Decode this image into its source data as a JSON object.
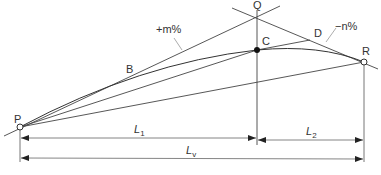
{
  "diagram": {
    "type": "vertical-curve-crest",
    "colors": {
      "line": "#444444",
      "text": "#333333",
      "background": "#ffffff"
    },
    "points": {
      "P": {
        "label": "P",
        "marker": "open-circle"
      },
      "Q": {
        "label": "Q",
        "marker": "none"
      },
      "C": {
        "label": "C",
        "marker": "filled-dot"
      },
      "D": {
        "label": "D",
        "marker": "none"
      },
      "R": {
        "label": "R",
        "marker": "open-circle"
      },
      "B": {
        "label": "B",
        "marker": "none"
      }
    },
    "grades": {
      "rising": "+m%",
      "falling": "−n%"
    },
    "dimensions": {
      "L1": {
        "main": "L",
        "sub": "1"
      },
      "L2": {
        "main": "L",
        "sub": "2"
      },
      "Lv": {
        "main": "L",
        "sub": "v"
      }
    }
  }
}
